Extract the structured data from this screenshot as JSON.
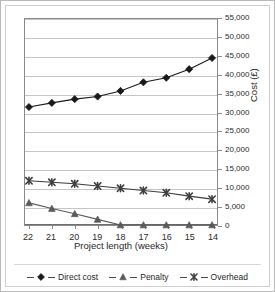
{
  "chart_data": {
    "type": "line",
    "title": "",
    "subtitle": "",
    "xlabel": "Project length (weeks)",
    "ylabel": "Cost (£)",
    "categories": [
      "22",
      "21",
      "20",
      "19",
      "18",
      "17",
      "16",
      "15",
      "14"
    ],
    "x": [
      22,
      21,
      20,
      19,
      18,
      17,
      16,
      15,
      14
    ],
    "xlim": [
      22,
      14
    ],
    "ylim": [
      0,
      55000
    ],
    "ytick_values": [
      0,
      5000,
      10000,
      15000,
      20000,
      25000,
      30000,
      35000,
      40000,
      45000,
      50000,
      55000
    ],
    "ytick_labels": [
      "0",
      "5,000",
      "10,000",
      "15,000",
      "20,000",
      "25,000",
      "30,000",
      "35,000",
      "40,000",
      "45,000",
      "50,000",
      "55,000"
    ],
    "grid": true,
    "grid_axis": "y",
    "legend_position": "bottom",
    "series": [
      {
        "name": "Direct cost",
        "marker": "diamond",
        "color": "#1a1a1a",
        "values": [
          31500,
          32600,
          33600,
          34300,
          35800,
          38100,
          39300,
          41600,
          44600
        ]
      },
      {
        "name": "Penalty",
        "marker": "triangle",
        "color": "#5a5a5a",
        "values": [
          5900,
          4400,
          3000,
          1500,
          0,
          0,
          0,
          0,
          0
        ]
      },
      {
        "name": "Overhead",
        "marker": "x",
        "color": "#3d3d3d",
        "values": [
          11800,
          11400,
          11000,
          10400,
          9800,
          9200,
          8600,
          7700,
          6900
        ]
      }
    ]
  },
  "axes": {
    "x_title": "Project length (weeks)",
    "y_title": "Cost (£)"
  },
  "legend": {
    "items": [
      {
        "label": "Direct cost",
        "marker": "diamond-marker-icon"
      },
      {
        "label": "Penalty",
        "marker": "triangle-marker-icon"
      },
      {
        "label": "Overhead",
        "marker": "x-marker-icon"
      }
    ]
  },
  "style": {
    "plot_border": "#8a8a8a",
    "gridline": "#c4c4c4",
    "frame_outer": "#b9b9b9",
    "frame_inner": "#cfcfcf",
    "background": "#ffffff",
    "text": "#1f1f1f"
  }
}
